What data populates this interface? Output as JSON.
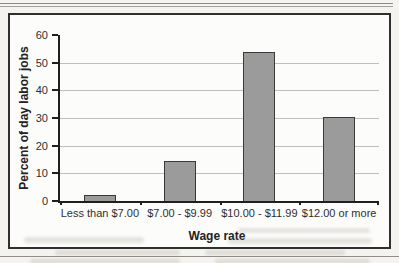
{
  "page": {
    "background_color": "#f4f3f0",
    "frame_background": "#fcfcfb"
  },
  "chart_data": {
    "type": "bar",
    "title": "",
    "categories": [
      "Less than $7.00",
      "$7.00 - $9.99",
      "$10.00 - $11.99",
      "$12.00 or more"
    ],
    "values": [
      2,
      14.5,
      54,
      30.5
    ],
    "xlabel": "Wage rate",
    "ylabel": "Percent of day labor jobs",
    "ylim": [
      0,
      60
    ],
    "yticks": [
      0,
      10,
      20,
      30,
      40,
      50,
      60
    ],
    "grid": true,
    "gridline_values": [
      10,
      20,
      30,
      40,
      50
    ],
    "legend": false,
    "bar_fill": "#9b9b9b",
    "bar_border": "#3a3a3a",
    "gridline_color": "#bfbfbf",
    "axis_color": "#1f1f1f",
    "frame_border_color": "#2f2f2f"
  }
}
